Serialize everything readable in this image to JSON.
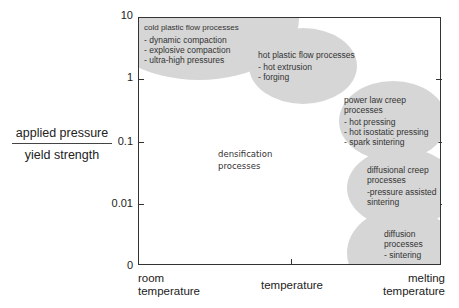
{
  "diagram": {
    "y_axis": {
      "label_numerator": "applied pressure",
      "label_denominator": "yield strength",
      "ticks": [
        "10",
        "1",
        "0.1",
        "0.01",
        "0"
      ]
    },
    "x_axis": {
      "label_left": [
        "room",
        "temperature"
      ],
      "label_center": "temperature",
      "label_right": [
        "melting",
        "temperature"
      ]
    },
    "regions": [
      {
        "title": "cold plastic flow processes",
        "items": [
          "- dynamic compaction",
          "- explosive compaction",
          "- ultra-high pressures"
        ]
      },
      {
        "title": "hot plastic flow processes",
        "items": [
          "- hot extrusion",
          "- forging"
        ]
      },
      {
        "title_lines": [
          "power law creep",
          "processes"
        ],
        "items": [
          "- hot pressing",
          "- hot isostatic pressing",
          "- spark sintering"
        ]
      },
      {
        "title_lines": [
          "diffusional creep",
          "processes"
        ],
        "items": [
          "-pressure assisted",
          "sintering"
        ]
      },
      {
        "title_lines": [
          "diffusion",
          "processes"
        ],
        "items": [
          "- sintering"
        ]
      }
    ],
    "center_label": [
      "densification",
      "processes"
    ],
    "colors": {
      "region_fill": "#d6d6d6",
      "axis": "#333333"
    }
  }
}
